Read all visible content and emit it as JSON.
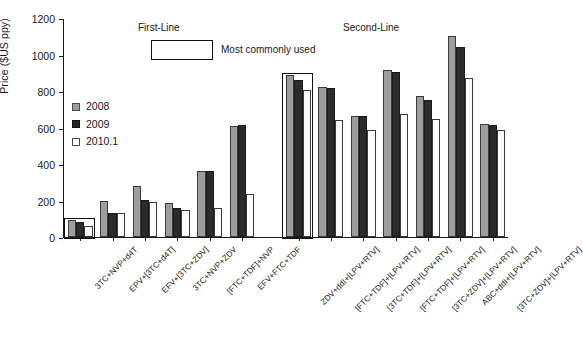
{
  "chart_data": {
    "type": "bar",
    "title": "",
    "xlabel": "",
    "ylabel": "Price ($US ppy)",
    "ylim": [
      0,
      1200
    ],
    "yticks": [
      0,
      200,
      400,
      600,
      800,
      1000,
      1200
    ],
    "grid": false,
    "legend_position": "upper-left-inside",
    "categories": [
      "3TC+NVP+d4T",
      "EPV+[3TC+d4T]",
      "EFV+[3TC+ZDV]",
      "3TC+NVP+ZDV",
      "[FTC+TDF]+NVP",
      "EFV+FTC+TDF",
      "ZDV+ddI+[LPV+RTV]",
      "[FTC+TDF]+[LPV+RTV]",
      "[3TC+TDF]+[LPV+RTV]",
      "[FTC+TDF]+[LPV+RTV]",
      "[3TC+ZDV]+[LPV+RTV]",
      "ABC+ddI+[LPV+RTV]",
      "[3TC+ZDV]+[LPV+RTV]"
    ],
    "series": [
      {
        "name": "2008",
        "color": "#9d9d9d",
        "values": [
          94,
          197,
          280,
          185,
          360,
          610,
          890,
          820,
          665,
          915,
          775,
          1100,
          617
        ]
      },
      {
        "name": "2009",
        "color": "#2b2b2b",
        "values": [
          83,
          130,
          205,
          160,
          360,
          612,
          860,
          818,
          665,
          905,
          750,
          1040,
          612
        ]
      },
      {
        "name": "2010.1",
        "color": "#ffffff",
        "values": [
          61,
          130,
          193,
          148,
          160,
          238,
          805,
          640,
          585,
          675,
          648,
          870,
          584
        ]
      }
    ],
    "annotations": [
      {
        "name": "first-line-title",
        "text": "First-Line"
      },
      {
        "name": "second-line-title",
        "text": "Second-Line"
      },
      {
        "name": "most-commonly-used-label",
        "text": "Most commonly used"
      }
    ],
    "highlighted_groups": [
      "3TC+NVP+d4T",
      "ZDV+ddI+[LPV+RTV]"
    ]
  },
  "axis": {
    "y_label": "Price ($US ppy)",
    "y_ticks": [
      "1200",
      "1000",
      "800",
      "600",
      "400",
      "200",
      "0"
    ]
  },
  "legend": {
    "items": [
      {
        "label": "2008",
        "swatch": "filled-gray-swatch"
      },
      {
        "label": "2009",
        "swatch": "filled-black-swatch"
      },
      {
        "label": "2010.1",
        "swatch": "outlined-white-swatch"
      }
    ]
  },
  "sections": {
    "first_line": "First-Line",
    "second_line": "Second-Line",
    "most_commonly_used": "Most commonly used"
  }
}
